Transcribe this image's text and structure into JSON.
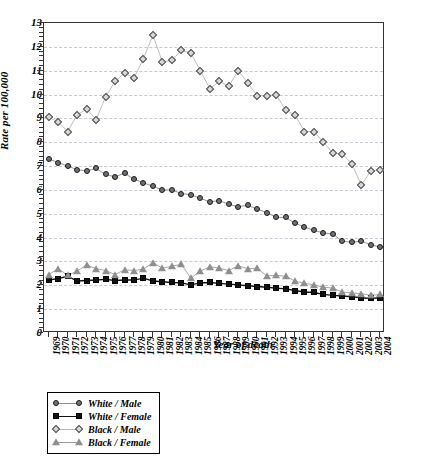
{
  "chart_data": {
    "type": "line",
    "title": "",
    "xlabel": "Year of death",
    "ylabel": "Rate per 100,000",
    "ylim": [
      0,
      13
    ],
    "ytick_step": 1,
    "grid": true,
    "legend_position": "below-axis",
    "x": [
      1969,
      1970,
      1971,
      1972,
      1973,
      1974,
      1975,
      1976,
      1977,
      1978,
      1979,
      1980,
      1981,
      1982,
      1983,
      1984,
      1985,
      1986,
      1987,
      1988,
      1989,
      1990,
      1991,
      1992,
      1993,
      1994,
      1995,
      1996,
      1997,
      1998,
      1999,
      2000,
      2001,
      2002,
      2003,
      2004
    ],
    "categories": [
      "1969",
      "1970",
      "1971",
      "1972",
      "1973",
      "1974",
      "1975",
      "1976",
      "1977",
      "1978",
      "1979",
      "1980",
      "1981",
      "1982",
      "1983",
      "1984",
      "1985",
      "1986",
      "1987",
      "1988",
      "1989",
      "1990",
      "1991",
      "1992",
      "1993",
      "1994",
      "1995",
      "1996",
      "1997",
      "1998",
      "1999",
      "2000",
      "2001",
      "2002",
      "2003",
      "2004"
    ],
    "ytick_labels": [
      "0",
      "1",
      "2",
      "3",
      "4",
      "5",
      "6",
      "7",
      "8",
      "9",
      "10",
      "11",
      "12",
      "13"
    ],
    "series": [
      {
        "name": "White / Male",
        "marker": "circle",
        "values": [
          7.3,
          7.15,
          7.0,
          6.85,
          6.8,
          6.9,
          6.65,
          6.55,
          6.7,
          6.45,
          6.3,
          6.15,
          6.0,
          6.0,
          5.85,
          5.8,
          5.65,
          5.5,
          5.55,
          5.4,
          5.3,
          5.35,
          5.2,
          5.05,
          4.85,
          4.85,
          4.6,
          4.45,
          4.3,
          4.2,
          4.15,
          3.85,
          3.8,
          3.85,
          3.7,
          3.6
        ]
      },
      {
        "name": "White / Female",
        "marker": "square",
        "values": [
          2.22,
          2.28,
          2.38,
          2.18,
          2.2,
          2.22,
          2.25,
          2.2,
          2.22,
          2.22,
          2.3,
          2.18,
          2.15,
          2.12,
          2.1,
          2.02,
          2.1,
          2.12,
          2.08,
          2.05,
          2.02,
          1.98,
          1.95,
          1.92,
          1.88,
          1.85,
          1.78,
          1.72,
          1.7,
          1.62,
          1.58,
          1.55,
          1.52,
          1.48,
          1.45,
          1.48
        ]
      },
      {
        "name": "Black / Male",
        "marker": "diamond",
        "values": [
          9.05,
          8.85,
          8.45,
          9.15,
          9.4,
          8.95,
          9.9,
          10.55,
          10.9,
          10.7,
          11.5,
          12.5,
          11.35,
          11.45,
          11.85,
          11.75,
          11.0,
          10.25,
          10.55,
          10.35,
          11.0,
          10.5,
          9.95,
          9.95,
          10.0,
          9.35,
          9.15,
          8.45,
          8.45,
          8.0,
          7.55,
          7.5,
          7.1,
          6.2,
          6.8,
          6.85
        ]
      },
      {
        "name": "Black / Female",
        "marker": "triangle",
        "values": [
          2.45,
          2.7,
          2.42,
          2.6,
          2.85,
          2.7,
          2.62,
          2.45,
          2.65,
          2.62,
          2.68,
          2.95,
          2.72,
          2.8,
          2.88,
          2.3,
          2.6,
          2.78,
          2.72,
          2.62,
          2.82,
          2.7,
          2.72,
          2.4,
          2.42,
          2.38,
          2.18,
          2.08,
          2.02,
          1.92,
          1.88,
          1.72,
          1.68,
          1.65,
          1.58,
          1.62
        ]
      }
    ]
  },
  "legend": {
    "items": [
      {
        "label": "White / Male"
      },
      {
        "label": "White / Female"
      },
      {
        "label": "Black / Male"
      },
      {
        "label": "Black / Female"
      }
    ]
  }
}
